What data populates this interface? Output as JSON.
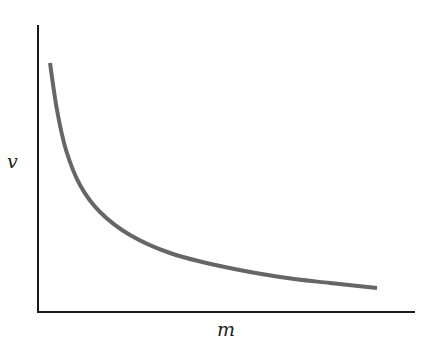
{
  "chart_data": {
    "type": "line",
    "title": "",
    "xlabel": "m",
    "ylabel": "v",
    "grid": false,
    "legend": null,
    "ticks": "none",
    "series": [
      {
        "name": "v vs m",
        "color": "#666666",
        "points_px": [
          [
            50,
            63
          ],
          [
            57,
            110
          ],
          [
            66,
            150
          ],
          [
            80,
            185
          ],
          [
            100,
            212
          ],
          [
            130,
            235
          ],
          [
            170,
            253
          ],
          [
            220,
            266
          ],
          [
            280,
            277
          ],
          [
            330,
            283
          ],
          [
            377,
            288
          ]
        ]
      }
    ],
    "axes_px": {
      "origin": [
        38,
        312
      ],
      "y_top": 25,
      "x_right": 415
    }
  },
  "labels": {
    "x": "m",
    "y": "v"
  }
}
